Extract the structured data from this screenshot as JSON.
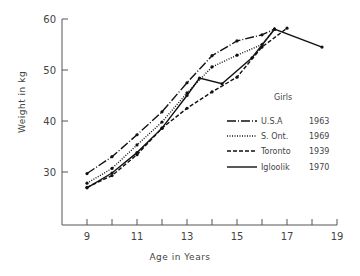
{
  "chart_data": {
    "type": "line",
    "title": "",
    "xlabel": "Age in Years",
    "ylabel": "Weight in kg",
    "xlim": [
      8.0,
      19
    ],
    "ylim": [
      20,
      60
    ],
    "x_ticks": [
      9,
      10,
      11,
      12,
      13,
      14,
      15,
      16,
      17,
      18,
      19
    ],
    "x_tick_labels": [
      "9",
      "",
      "11",
      "",
      "13",
      "",
      "15",
      "",
      "17",
      "",
      "19"
    ],
    "y_ticks": [
      30,
      40,
      50,
      60
    ],
    "y_tick_labels": [
      "30",
      "40",
      "50",
      "60"
    ],
    "grid": false,
    "legend_title": "Girls",
    "legend_position": "right-middle",
    "series": [
      {
        "name": "U.S.A",
        "year": "1963",
        "style": "dash-dot",
        "x": [
          9,
          10,
          11,
          12,
          13,
          14,
          15,
          16,
          16.5
        ],
        "y": [
          29.7,
          33.0,
          37.3,
          41.8,
          47.5,
          52.8,
          55.7,
          56.9,
          58.0
        ]
      },
      {
        "name": "S. Ont.",
        "year": "1969",
        "style": "dotted",
        "x": [
          9,
          10,
          11,
          12,
          13,
          14,
          15,
          16,
          16.5
        ],
        "y": [
          27.8,
          30.7,
          35.3,
          39.8,
          45.5,
          50.6,
          52.9,
          55.0,
          58.0
        ]
      },
      {
        "name": "Toronto",
        "year": "1939",
        "style": "dashed",
        "x": [
          9,
          10,
          11,
          12,
          13,
          14,
          15,
          16,
          17
        ],
        "y": [
          27.0,
          29.3,
          33.4,
          38.6,
          42.5,
          45.7,
          48.6,
          54.5,
          58.2
        ]
      },
      {
        "name": "Igloolik",
        "year": "1970",
        "style": "solid",
        "x": [
          9,
          10,
          11,
          12,
          13,
          13.5,
          14.4,
          15.6,
          16.5,
          18.4
        ],
        "y": [
          26.9,
          29.8,
          33.8,
          38.6,
          45.0,
          48.4,
          47.3,
          52.4,
          58.0,
          54.5
        ]
      }
    ]
  },
  "legend": {
    "title": "Girls",
    "entries": [
      {
        "label": "U.S.A",
        "year": "1963"
      },
      {
        "label": "S. Ont.",
        "year": "1969"
      },
      {
        "label": "Toronto",
        "year": "1939"
      },
      {
        "label": "Igloolik",
        "year": "1970"
      }
    ]
  },
  "axes": {
    "xlabel": "Age in Years",
    "ylabel": "Weight in kg"
  }
}
